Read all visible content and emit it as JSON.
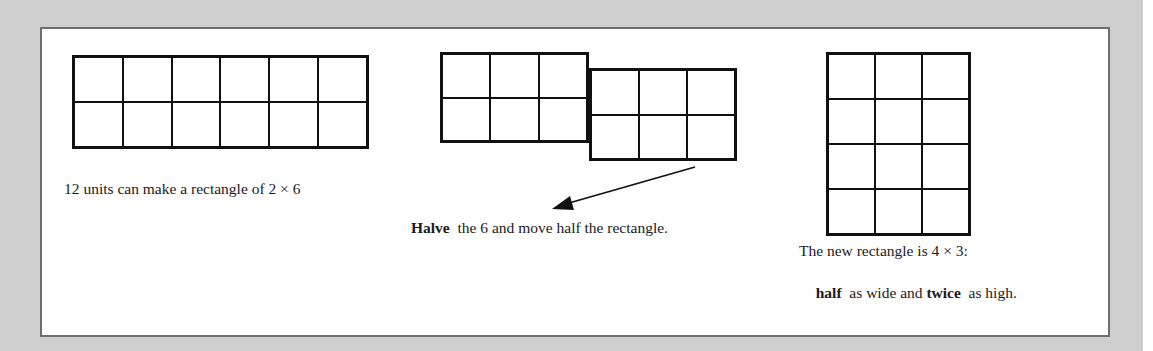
{
  "diagram": {
    "panels": [
      {
        "id": "original",
        "grid": {
          "rows": 2,
          "cols": 6
        },
        "caption": "12 units can make a rectangle of  2 × 6"
      },
      {
        "id": "halve-move",
        "grids": [
          {
            "rows": 2,
            "cols": 3
          },
          {
            "rows": 2,
            "cols": 3
          }
        ],
        "caption_bold": "Halve",
        "caption_rest": "  the 6 and move half the rectangle."
      },
      {
        "id": "result",
        "grid": {
          "rows": 4,
          "cols": 3
        },
        "caption_line1": "The new rectangle is 4 × 3:",
        "caption_line2_bold1": "half",
        "caption_line2_mid": "  as wide and ",
        "caption_line2_bold2": "twice",
        "caption_line2_end": "  as high."
      }
    ],
    "colors": {
      "background": "#cfcfcf",
      "panel": "#ffffff",
      "border": "#6e6e6e",
      "lines": "#111111"
    }
  }
}
